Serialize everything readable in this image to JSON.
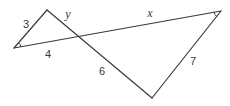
{
  "figure": {
    "side_labels": {
      "left_triangle_upper_left_side": "3",
      "left_triangle_base_segment": "4",
      "left_triangle_slant_segment": "y",
      "long_line_right_segment": "x",
      "right_triangle_lower_left_side": "6",
      "right_triangle_right_side": "7"
    },
    "marked_angles": [
      "left-vertex",
      "right-vertex"
    ],
    "colors": {
      "stroke": "#3a3a3a",
      "background": "#ffffff",
      "label": "#3a3a3a"
    }
  }
}
